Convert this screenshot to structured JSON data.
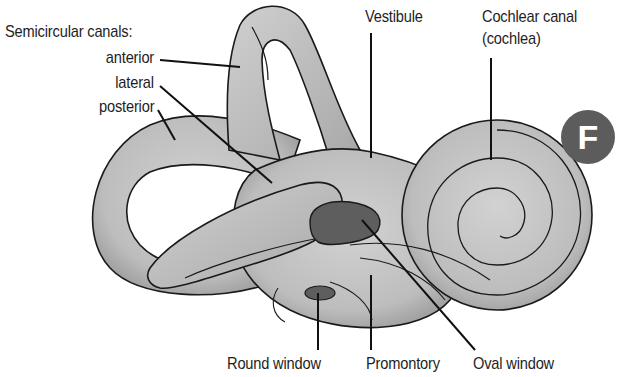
{
  "figure": {
    "badge": "F",
    "colors": {
      "structure_fill": "#c4c4c4",
      "structure_shade": "#9a9a9a",
      "window_fill": "#5e5e5e",
      "outline": "#1a1a1a",
      "badge": "#5c5c5c"
    }
  },
  "labels": {
    "semicircular_heading": "Semicircular canals:",
    "anterior": "anterior",
    "lateral": "lateral",
    "posterior": "posterior",
    "vestibule": "Vestibule",
    "cochlear_line1": "Cochlear canal",
    "cochlear_line2": "(cochlea)",
    "round_window": "Round window",
    "promontory": "Promontory",
    "oval_window": "Oval window"
  }
}
